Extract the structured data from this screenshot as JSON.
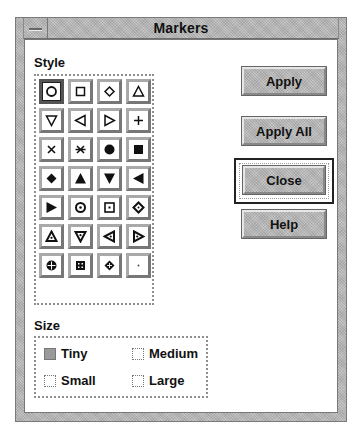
{
  "window": {
    "title": "Markers",
    "menu_icon": "window-menu-icon"
  },
  "style": {
    "label": "Style",
    "selected_index": 0,
    "markers": [
      {
        "name": "circle-open-icon"
      },
      {
        "name": "square-open-icon"
      },
      {
        "name": "diamond-open-icon"
      },
      {
        "name": "triangle-up-open-icon"
      },
      {
        "name": "triangle-down-open-icon"
      },
      {
        "name": "triangle-left-open-icon"
      },
      {
        "name": "triangle-right-open-icon"
      },
      {
        "name": "plus-icon"
      },
      {
        "name": "cross-icon"
      },
      {
        "name": "asterisk-icon"
      },
      {
        "name": "circle-filled-icon"
      },
      {
        "name": "square-filled-icon"
      },
      {
        "name": "diamond-filled-icon"
      },
      {
        "name": "triangle-up-filled-icon"
      },
      {
        "name": "triangle-down-filled-icon"
      },
      {
        "name": "triangle-left-filled-icon"
      },
      {
        "name": "triangle-right-filled-icon"
      },
      {
        "name": "circle-dot-icon"
      },
      {
        "name": "square-dot-icon"
      },
      {
        "name": "diamond-dot-icon"
      },
      {
        "name": "triangle-up-dot-icon"
      },
      {
        "name": "triangle-down-dot-icon"
      },
      {
        "name": "triangle-left-dot-icon"
      },
      {
        "name": "triangle-right-dot-icon"
      },
      {
        "name": "circle-cross-icon"
      },
      {
        "name": "square-cross-icon"
      },
      {
        "name": "diamond-cross-icon"
      },
      {
        "name": "point-icon"
      }
    ]
  },
  "buttons": {
    "apply": "Apply",
    "apply_all": "Apply All",
    "close": "Close",
    "help": "Help"
  },
  "size": {
    "label": "Size",
    "selected": "Tiny",
    "options": [
      {
        "label": "Tiny",
        "selected": true
      },
      {
        "label": "Medium",
        "selected": false
      },
      {
        "label": "Small",
        "selected": false
      },
      {
        "label": "Large",
        "selected": false
      }
    ]
  },
  "colors": {
    "frame_gray": "#b8b8b8",
    "selected_fill": "#9a9a9a",
    "text": "#111111"
  }
}
